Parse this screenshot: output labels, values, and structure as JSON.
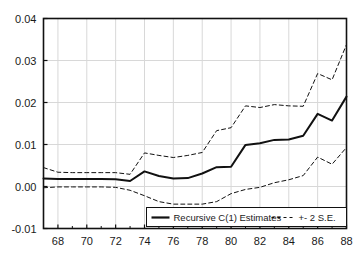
{
  "chart_data": {
    "type": "line",
    "title": "",
    "subtitle": "",
    "xlabel": "",
    "ylabel": "",
    "xlim": [
      67,
      88
    ],
    "ylim": [
      -0.01,
      0.04
    ],
    "grid": true,
    "legend_position": "bottom-center",
    "x_tick_labels": [
      "68",
      "70",
      "72",
      "74",
      "76",
      "78",
      "80",
      "82",
      "84",
      "86",
      "88"
    ],
    "x_ticks": [
      68,
      70,
      72,
      74,
      76,
      78,
      80,
      82,
      84,
      86,
      88
    ],
    "y_tick_labels": [
      "0.04",
      "0.03",
      "0.02",
      "0.01",
      "0.00",
      "-0.01"
    ],
    "y_ticks": [
      0.04,
      0.03,
      0.02,
      0.01,
      0.0,
      -0.01
    ],
    "x": [
      67,
      68,
      69,
      70,
      71,
      72,
      73,
      74,
      75,
      76,
      77,
      78,
      79,
      80,
      81,
      82,
      83,
      84,
      85,
      86,
      87,
      88
    ],
    "series": [
      {
        "name": "Recursive C(1) Estimates",
        "style": "solid",
        "color": "#111111",
        "width": 2.0,
        "values": [
          0.0019,
          0.0018,
          0.0018,
          0.0018,
          0.0018,
          0.0017,
          0.0013,
          0.0036,
          0.0025,
          0.0019,
          0.002,
          0.0031,
          0.0046,
          0.0047,
          0.0099,
          0.0103,
          0.0111,
          0.0112,
          0.0121,
          0.0173,
          0.0157,
          0.0214
        ]
      },
      {
        "name": "+ 2 S.E.",
        "style": "dashed",
        "color": "#111111",
        "width": 1.0,
        "values": [
          0.0045,
          0.0034,
          0.0033,
          0.0033,
          0.0033,
          0.0033,
          0.0029,
          0.008,
          0.0074,
          0.0069,
          0.0074,
          0.0081,
          0.0133,
          0.014,
          0.0192,
          0.0188,
          0.0195,
          0.0192,
          0.0191,
          0.0269,
          0.0254,
          0.0338
        ]
      },
      {
        "name": "- 2 S.E.",
        "style": "dashed",
        "color": "#111111",
        "width": 1.0,
        "values": [
          -0.0003,
          -0.0001,
          -0.0001,
          -0.0001,
          -0.0001,
          -0.0002,
          -0.0009,
          -0.0022,
          -0.0036,
          -0.0042,
          -0.0042,
          -0.0042,
          -0.0036,
          -0.0017,
          -0.0007,
          -0.0002,
          0.0009,
          0.0016,
          0.0026,
          0.007,
          0.0053,
          0.0093
        ]
      }
    ],
    "legend": [
      {
        "label": "Recursive C(1) Estimates",
        "marker": "solid-line"
      },
      {
        "label": "+- 2 S.E.",
        "marker": "dashed-line"
      }
    ]
  },
  "axes": {
    "frame_color": "#111111",
    "grid_color": "#d8d8d8",
    "background": "#ffffff"
  }
}
